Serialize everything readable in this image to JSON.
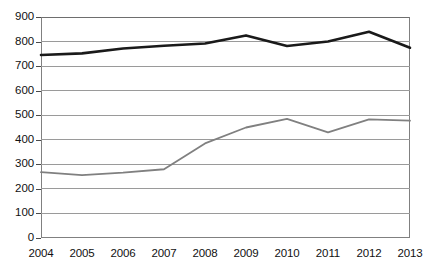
{
  "chart_data": {
    "type": "line",
    "title": "",
    "subtitle": "",
    "xlabel": "",
    "ylabel": "",
    "categories": [
      "2004",
      "2005",
      "2006",
      "2007",
      "2008",
      "2009",
      "2010",
      "2011",
      "2012",
      "2013"
    ],
    "x": [
      2004,
      2005,
      2006,
      2007,
      2008,
      2009,
      2010,
      2011,
      2012,
      2013
    ],
    "series": [
      {
        "name": "upper-series",
        "color": "#1a1a1a",
        "line_width": 2.6,
        "values": [
          745,
          752,
          772,
          783,
          792,
          825,
          782,
          800,
          840,
          775
        ]
      },
      {
        "name": "lower-series",
        "color": "#808080",
        "line_width": 1.8,
        "values": [
          268,
          256,
          266,
          280,
          385,
          450,
          485,
          430,
          483,
          478
        ]
      }
    ],
    "ylim": [
      0,
      900
    ],
    "ytick_step": 100,
    "yticks": [
      0,
      100,
      200,
      300,
      400,
      500,
      600,
      700,
      800,
      900
    ],
    "ytick_labels": [
      "0",
      "100",
      "200",
      "300",
      "400",
      "500",
      "600",
      "700",
      "800",
      "900"
    ],
    "grid": true,
    "grid_axis": "y",
    "grid_color": "#9a9a9a",
    "legend": false,
    "legend_position": "none",
    "annotations": [],
    "frame_color": "#808080",
    "background": "#ffffff"
  }
}
